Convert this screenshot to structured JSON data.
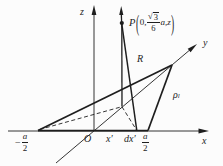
{
  "figure": {
    "colors": {
      "ink": "#1e1e1e",
      "background": "#fcfcfc"
    },
    "labels": {
      "axis_z": "z",
      "axis_y": "y",
      "axis_x": "x",
      "origin": "O",
      "x_prime": "x′",
      "dx_prime": "dx′",
      "r_distance": "R",
      "rho": {
        "base": "ρ",
        "subscript": "l"
      },
      "left_vertex_coord": {
        "minus": "−",
        "numerator": "a",
        "denominator": "2"
      },
      "right_vertex_coord": {
        "numerator": "a",
        "denominator": "2"
      },
      "point_p": {
        "name": "P",
        "open_paren": "(",
        "first": "0,",
        "sqrt_sign": "√",
        "radicand": "3",
        "denominator": "6",
        "rest": "a,z",
        "close_paren": ")"
      }
    }
  }
}
